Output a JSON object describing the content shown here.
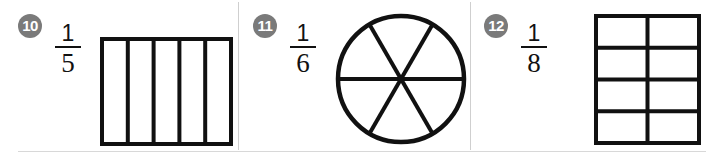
{
  "page": {
    "background_color": "#ffffff",
    "rule_color": "#d0d0d0",
    "ink_color": "#111111",
    "badge_color": "#7a7a7a",
    "badge_text_color": "#ffffff"
  },
  "problems": [
    {
      "number": "10",
      "fraction": {
        "numerator": "1",
        "denominator": "5"
      },
      "figure": {
        "shape_name": "rectangle-fifths",
        "kind": "rectangle",
        "columns": 5,
        "rows": 1,
        "parts": 5,
        "shaded_parts": 0
      }
    },
    {
      "number": "11",
      "fraction": {
        "numerator": "1",
        "denominator": "6"
      },
      "figure": {
        "shape_name": "circle-sixths",
        "kind": "circle",
        "sectors": 6,
        "parts": 6,
        "shaded_parts": 0
      }
    },
    {
      "number": "12",
      "fraction": {
        "numerator": "1",
        "denominator": "8"
      },
      "figure": {
        "shape_name": "rectangle-eighths",
        "kind": "rectangle",
        "columns": 2,
        "rows": 4,
        "parts": 8,
        "shaded_parts": 0
      }
    }
  ]
}
